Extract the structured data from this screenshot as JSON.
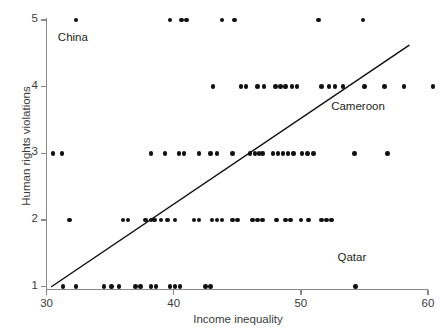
{
  "chart_data": {
    "type": "scatter",
    "title": "",
    "xlabel": "Income inequality",
    "ylabel": "Human rights violations",
    "xlim": [
      29.2,
      59.6
    ],
    "ylim": [
      0.55,
      5.3
    ],
    "xticks": [
      30,
      40,
      50,
      60
    ],
    "yticks": [
      1,
      2,
      3,
      4,
      5
    ],
    "grid": false,
    "legend": null,
    "series": [
      {
        "name": "Countries",
        "marker": "circle",
        "color": "#111111",
        "points": [
          [
            32.3,
            5
          ],
          [
            39.7,
            5
          ],
          [
            40.6,
            5
          ],
          [
            41.0,
            5
          ],
          [
            43.8,
            5
          ],
          [
            44.8,
            5
          ],
          [
            51.4,
            5
          ],
          [
            54.9,
            5
          ],
          [
            43.1,
            4
          ],
          [
            45.3,
            4
          ],
          [
            45.7,
            4
          ],
          [
            46.6,
            4
          ],
          [
            47.1,
            4
          ],
          [
            48.0,
            4
          ],
          [
            48.4,
            4
          ],
          [
            48.8,
            4
          ],
          [
            49.3,
            4
          ],
          [
            49.7,
            4
          ],
          [
            51.6,
            4
          ],
          [
            52.2,
            4
          ],
          [
            52.7,
            4
          ],
          [
            53.3,
            4
          ],
          [
            55.0,
            4
          ],
          [
            56.6,
            4
          ],
          [
            58.1,
            4
          ],
          [
            60.4,
            4
          ],
          [
            30.5,
            3
          ],
          [
            31.2,
            3
          ],
          [
            38.2,
            3
          ],
          [
            39.3,
            3
          ],
          [
            40.4,
            3
          ],
          [
            40.8,
            3
          ],
          [
            42.0,
            3
          ],
          [
            42.9,
            3
          ],
          [
            43.4,
            3
          ],
          [
            44.6,
            3
          ],
          [
            46.0,
            3
          ],
          [
            46.4,
            3
          ],
          [
            46.7,
            3
          ],
          [
            47.0,
            3
          ],
          [
            47.8,
            3
          ],
          [
            48.2,
            3
          ],
          [
            48.6,
            3
          ],
          [
            49.0,
            3
          ],
          [
            49.4,
            3
          ],
          [
            50.1,
            3
          ],
          [
            50.5,
            3
          ],
          [
            51.0,
            3
          ],
          [
            54.2,
            3
          ],
          [
            56.8,
            3
          ],
          [
            31.8,
            2
          ],
          [
            36.0,
            2
          ],
          [
            36.4,
            2
          ],
          [
            37.8,
            2
          ],
          [
            38.2,
            2
          ],
          [
            38.5,
            2
          ],
          [
            39.0,
            2
          ],
          [
            39.5,
            2
          ],
          [
            40.1,
            2
          ],
          [
            41.6,
            2
          ],
          [
            42.0,
            2
          ],
          [
            43.0,
            2
          ],
          [
            43.4,
            2
          ],
          [
            43.8,
            2
          ],
          [
            44.6,
            2
          ],
          [
            45.0,
            2
          ],
          [
            46.2,
            2
          ],
          [
            46.6,
            2
          ],
          [
            47.0,
            2
          ],
          [
            48.1,
            2
          ],
          [
            48.8,
            2
          ],
          [
            49.2,
            2
          ],
          [
            50.0,
            2
          ],
          [
            50.6,
            2
          ],
          [
            51.6,
            2
          ],
          [
            52.0,
            2
          ],
          [
            52.4,
            2
          ],
          [
            31.3,
            1
          ],
          [
            32.3,
            1
          ],
          [
            34.5,
            1
          ],
          [
            35.1,
            1
          ],
          [
            35.7,
            1
          ],
          [
            37.0,
            1
          ],
          [
            37.4,
            1
          ],
          [
            38.2,
            1
          ],
          [
            38.6,
            1
          ],
          [
            39.7,
            1
          ],
          [
            40.1,
            1
          ],
          [
            40.5,
            1
          ],
          [
            42.5,
            1
          ],
          [
            42.9,
            1
          ],
          [
            54.3,
            1
          ]
        ]
      }
    ],
    "trendline": {
      "name": "linear fit",
      "color": "#111111",
      "x0": 30.4,
      "y0": 1.0,
      "x1": 58.5,
      "y1": 4.62
    },
    "annotations": [
      {
        "name": "china",
        "label": "China",
        "x": 32.3,
        "y": 4.72
      },
      {
        "name": "cameroon",
        "label": "Cameroon",
        "x": 53.8,
        "y": 3.68
      },
      {
        "name": "qatar",
        "label": "Qatar",
        "x": 54.3,
        "y": 1.42
      }
    ]
  }
}
